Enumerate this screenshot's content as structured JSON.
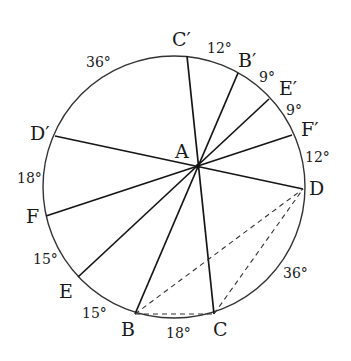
{
  "diagram": {
    "circle": {
      "cx": 174,
      "cy": 187,
      "r": 131,
      "stroke": "#333333"
    },
    "center_point": {
      "name": "A",
      "x": 198,
      "y": 166
    },
    "chords": [
      {
        "from": "C′",
        "to": "C",
        "x1": 187,
        "y1": 56,
        "x2": 214,
        "y2": 314
      },
      {
        "from": "B′",
        "to": "B",
        "x1": 238,
        "y1": 73,
        "x2": 135,
        "y2": 314
      },
      {
        "from": "E′",
        "to": "E",
        "x1": 269,
        "y1": 99,
        "x2": 78,
        "y2": 277
      },
      {
        "from": "F′",
        "to": "F",
        "x1": 292,
        "y1": 135,
        "x2": 46,
        "y2": 216
      },
      {
        "from": "D′",
        "to": "D",
        "x1": 55,
        "y1": 136,
        "x2": 303,
        "y2": 189
      }
    ],
    "dashed_segments": [
      {
        "from": "B",
        "to": "C",
        "x1": 135,
        "y1": 314,
        "x2": 214,
        "y2": 314
      },
      {
        "from": "B",
        "to": "D",
        "x1": 135,
        "y1": 314,
        "x2": 303,
        "y2": 189
      },
      {
        "from": "C",
        "to": "D",
        "x1": 214,
        "y1": 314,
        "x2": 303,
        "y2": 189
      }
    ],
    "point_labels": [
      {
        "text": "A",
        "x": 175,
        "y": 158
      },
      {
        "text": "C′",
        "x": 172,
        "y": 46
      },
      {
        "text": "B′",
        "x": 238,
        "y": 67
      },
      {
        "text": "E′",
        "x": 279,
        "y": 95
      },
      {
        "text": "F′",
        "x": 301,
        "y": 136
      },
      {
        "text": "D",
        "x": 309,
        "y": 195
      },
      {
        "text": "C",
        "x": 213,
        "y": 336
      },
      {
        "text": "B",
        "x": 121,
        "y": 336
      },
      {
        "text": "E",
        "x": 59,
        "y": 298
      },
      {
        "text": "F",
        "x": 26,
        "y": 223
      },
      {
        "text": "D′",
        "x": 30,
        "y": 140
      }
    ],
    "angle_labels": [
      {
        "text": "36°",
        "x": 86,
        "y": 67
      },
      {
        "text": "12°",
        "x": 207,
        "y": 53
      },
      {
        "text": "9°",
        "x": 259,
        "y": 82
      },
      {
        "text": "9°",
        "x": 286,
        "y": 115
      },
      {
        "text": "12°",
        "x": 305,
        "y": 162
      },
      {
        "text": "36°",
        "x": 283,
        "y": 278
      },
      {
        "text": "18°",
        "x": 166,
        "y": 338
      },
      {
        "text": "15°",
        "x": 82,
        "y": 318
      },
      {
        "text": "15°",
        "x": 33,
        "y": 264
      },
      {
        "text": "18°",
        "x": 17,
        "y": 183
      }
    ]
  }
}
